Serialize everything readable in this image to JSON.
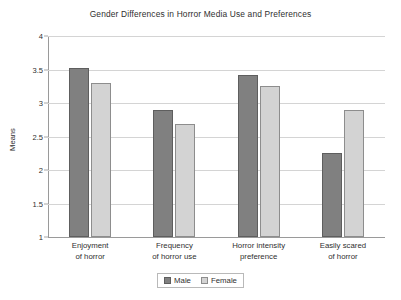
{
  "chart_data": {
    "type": "bar",
    "title": "Gender Differences in Horror Media Use and Preferences",
    "xlabel": "",
    "ylabel": "Means",
    "ylim": [
      1,
      4
    ],
    "yticks": [
      1,
      1.5,
      2,
      2.5,
      3,
      3.5,
      4
    ],
    "ytick_labels": [
      "1",
      "1.5",
      "2",
      "2.5",
      "3",
      "3.5",
      "4"
    ],
    "grid": true,
    "legend_position": "bottom-center",
    "categories": [
      "Enjoyment of horror",
      "Frequency of horror use",
      "Horror intensity preference",
      "Easily scared of horror"
    ],
    "category_lines": [
      [
        "Enjoyment",
        "of horror"
      ],
      [
        "Frequency",
        "of horror use"
      ],
      [
        "Horror intensity",
        "preference"
      ],
      [
        "Easily scared",
        "of horror"
      ]
    ],
    "series": [
      {
        "name": "Male",
        "color": "#808080",
        "values": [
          3.52,
          2.9,
          3.42,
          2.25
        ]
      },
      {
        "name": "Female",
        "color": "#d3d3d3",
        "values": [
          3.3,
          2.68,
          3.26,
          2.89
        ]
      }
    ]
  },
  "legend": {
    "items": [
      {
        "label": "Male"
      },
      {
        "label": "Female"
      }
    ]
  }
}
